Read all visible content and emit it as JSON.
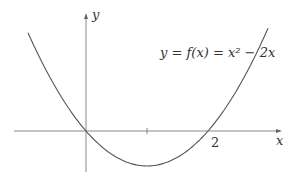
{
  "chart_data": {
    "type": "line",
    "title": "",
    "equation_label": "y = f(x) = x² − 2x",
    "xlabel": "x",
    "ylabel": "y",
    "x_tick_labels": [
      "2"
    ],
    "x_ticks": [
      1,
      2
    ],
    "function": "x^2 - 2x",
    "series": [
      {
        "name": "f(x) = x^2 - 2x",
        "x": [
          -1,
          -0.5,
          0,
          0.5,
          1,
          1.5,
          2,
          2.5,
          3
        ],
        "y": [
          3,
          1.25,
          0,
          -0.75,
          -1,
          -0.75,
          0,
          1.25,
          3
        ]
      }
    ],
    "grid": false,
    "colors": {
      "curve": "#555555",
      "axes": "#888888",
      "text": "#333333"
    }
  }
}
